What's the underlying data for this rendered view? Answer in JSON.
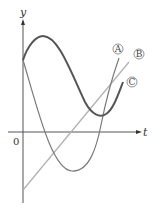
{
  "diagram": {
    "axes": {
      "x_label": "t",
      "y_label": "y",
      "origin_label": "0"
    },
    "curves": [
      {
        "id": "A",
        "label": "A",
        "description": "cubic-like curve starting at y-intercept, dipping below t-axis, rising steeply",
        "color": "#7a7a7a"
      },
      {
        "id": "B",
        "label": "B",
        "description": "straight line with positive slope starting below origin",
        "color": "#b0b0b0"
      },
      {
        "id": "C",
        "label": "C",
        "description": "wave: rises to maximum, falls to minimum above t-axis, then rises",
        "color": "#555555"
      }
    ]
  }
}
